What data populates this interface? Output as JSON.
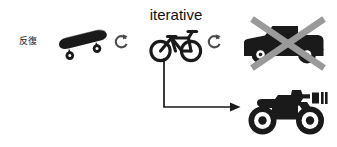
{
  "diagram": {
    "title_text": "iterative",
    "side_label": "反復",
    "background_color": "#ffffff",
    "ink_color": "#1a1a1a",
    "cross_color": "#9a9a9a",
    "stages": [
      {
        "id": "skateboard",
        "icon": "skateboard-icon",
        "order": 1,
        "state": "accepted"
      },
      {
        "id": "bicycle",
        "icon": "bicycle-icon",
        "order": 2,
        "state": "accepted",
        "caption": "iterative"
      },
      {
        "id": "car",
        "icon": "car-icon",
        "order": 3,
        "state": "rejected",
        "overlay": "cross-out-x"
      },
      {
        "id": "motorcycle",
        "icon": "motorcycle-icon",
        "order": 4,
        "state": "accepted"
      }
    ],
    "connectors": [
      {
        "id": "cycle-1",
        "icon": "refresh-cycle-icon",
        "from": "skateboard",
        "to": "bicycle"
      },
      {
        "id": "cycle-2",
        "icon": "refresh-cycle-icon",
        "from": "bicycle",
        "to": "car"
      },
      {
        "id": "elbow-arrow",
        "icon": "elbow-arrow-icon",
        "from": "bicycle",
        "to": "motorcycle"
      }
    ]
  }
}
